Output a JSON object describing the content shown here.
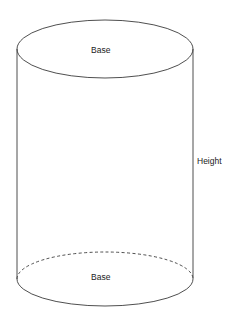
{
  "figure": {
    "caption_fragment": "lateral face.",
    "type": "cylinder-diagram",
    "background_color": "#ffffff",
    "stroke_color": "#3b3b3b",
    "text_color": "#1b1b1b"
  },
  "labels": {
    "base_top": "Base",
    "base_bottom": "Base",
    "height": "Height"
  },
  "geometry": {
    "center_x": 105,
    "radius_x": 88,
    "top_ellipse_center_y": 49,
    "top_ellipse_radius_y": 29,
    "bottom_ellipse_center_y": 279,
    "bottom_ellipse_radius_y": 27,
    "left_edge_x": 17,
    "right_edge_x": 193,
    "hidden_arc_style": "dashed",
    "visible_arc_style": "solid"
  }
}
